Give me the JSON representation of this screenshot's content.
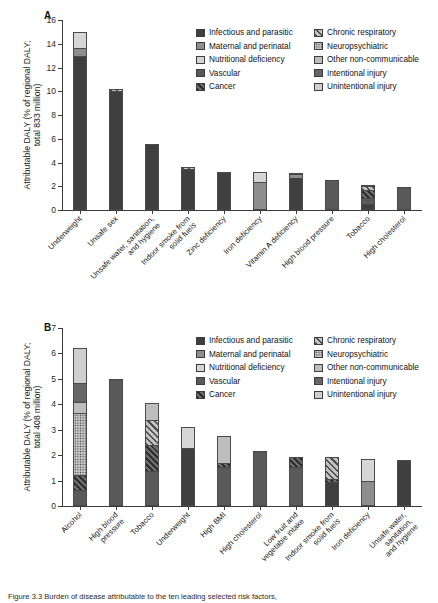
{
  "figure": {
    "caption": "Figure 3.3  Burden of disease attributable to the ten leading selected risk factors,",
    "panels": [
      "A",
      "B"
    ]
  },
  "legend": {
    "title": "",
    "entries": [
      {
        "label": "Infectious and parasitic",
        "key": "infectious",
        "color": "#3f3f3f",
        "pattern": "solid"
      },
      {
        "label": "Maternal and perinatal",
        "key": "maternal",
        "color": "#8d8d8d",
        "pattern": "solid"
      },
      {
        "label": "Nutritional deficiency",
        "key": "nutritional",
        "color": "#d6d6d6",
        "pattern": "solid"
      },
      {
        "label": "Vascular",
        "key": "vascular",
        "color": "#595959",
        "pattern": "solid"
      },
      {
        "label": "Cancer",
        "key": "cancer",
        "color": "#4a4a4a",
        "pattern": "diagonal-dark"
      },
      {
        "label": "Chronic respiratory",
        "key": "chronic_respiratory",
        "color": "#9a9a9a",
        "pattern": "diagonal-light"
      },
      {
        "label": "Neuropsychiatric",
        "key": "neuropsychiatric",
        "color": "#a8a8a8",
        "pattern": "dotted"
      },
      {
        "label": "Other non-communicable",
        "key": "other_noncomm",
        "color": "#bdbdbd",
        "pattern": "solid"
      },
      {
        "label": "Intentional injury",
        "key": "intentional_injury",
        "color": "#666666",
        "pattern": "solid"
      },
      {
        "label": "Unintentional injury",
        "key": "unintentional_injury",
        "color": "#cfcfcf",
        "pattern": "solid"
      }
    ]
  },
  "chart_data": [
    {
      "type": "bar",
      "panel": "A",
      "stacked": true,
      "title": "",
      "xlabel": "",
      "ylabel": "Attributable DALY (% of regional DALY; total 833 million)",
      "ylabel_line1": "Attributable DALY (% of regional DALY;",
      "ylabel_line2": "total 833 million)",
      "ylim": [
        0,
        16
      ],
      "yticks": [
        0,
        2,
        4,
        6,
        8,
        10,
        12,
        14,
        16
      ],
      "grid": false,
      "legend_position": "top-right",
      "categories": [
        "Underweight",
        "Unsafe sex",
        "Unsafe water, sanitation, and hygiene",
        "Indoor smoke from solid fuels",
        "Zinc deficiency",
        "Iron deficiency",
        "Vitamin A deficiency",
        "High blood pressure",
        "Tobacco",
        "High cholesterol"
      ],
      "category_lines": [
        [
          "Underweight"
        ],
        [
          "Unsafe sex"
        ],
        [
          "Unsafe water, sanitation,",
          "and hygiene"
        ],
        [
          "Indoor smoke from",
          "solid fuels"
        ],
        [
          "Zinc deficiency"
        ],
        [
          "Iron deficiency"
        ],
        [
          "Vitamin A deficiency"
        ],
        [
          "High blood pressure"
        ],
        [
          "Tobacco"
        ],
        [
          "High cholesterol"
        ]
      ],
      "totals": [
        15.0,
        10.2,
        5.55,
        3.65,
        3.2,
        3.2,
        3.1,
        2.55,
        2.1,
        1.9
      ],
      "series": [
        {
          "name": "Infectious and parasitic",
          "key": "infectious",
          "values": [
            12.95,
            10.05,
            5.55,
            3.45,
            3.2,
            0.0,
            2.65,
            0.0,
            0.4,
            0.0
          ]
        },
        {
          "name": "Maternal and perinatal",
          "key": "maternal",
          "values": [
            0.65,
            0.0,
            0.0,
            0.0,
            0.0,
            2.3,
            0.35,
            0.0,
            0.0,
            0.0
          ]
        },
        {
          "name": "Nutritional deficiency",
          "key": "nutritional",
          "values": [
            1.4,
            0.0,
            0.0,
            0.0,
            0.0,
            0.9,
            0.0,
            0.0,
            0.0,
            0.0
          ]
        },
        {
          "name": "Vascular",
          "key": "vascular",
          "values": [
            0.0,
            0.0,
            0.0,
            0.0,
            0.0,
            0.0,
            0.0,
            2.55,
            0.55,
            1.9
          ]
        },
        {
          "name": "Cancer",
          "key": "cancer",
          "values": [
            0.0,
            0.0,
            0.0,
            0.0,
            0.0,
            0.0,
            0.0,
            0.0,
            0.7,
            0.0
          ]
        },
        {
          "name": "Chronic respiratory",
          "key": "chronic_respiratory",
          "values": [
            0.0,
            0.15,
            0.0,
            0.2,
            0.0,
            0.0,
            0.0,
            0.0,
            0.35,
            0.0
          ]
        },
        {
          "name": "Other non-communicable",
          "key": "other_noncomm",
          "values": [
            0.0,
            0.0,
            0.0,
            0.0,
            0.0,
            0.0,
            0.1,
            0.0,
            0.1,
            0.0
          ]
        }
      ]
    },
    {
      "type": "bar",
      "panel": "B",
      "stacked": true,
      "title": "",
      "xlabel": "",
      "ylabel": "Attributable DALY (% of regional DALY; total 408 million)",
      "ylabel_line1": "Attributable DALY (% of regional DALY;",
      "ylabel_line2": "total 408 million)",
      "ylim": [
        0,
        7
      ],
      "yticks": [
        0,
        1,
        2,
        3,
        4,
        5,
        6,
        7
      ],
      "grid": false,
      "legend_position": "top-right",
      "categories": [
        "Alcohol",
        "High blood pressure",
        "Tobacco",
        "Underweight",
        "High BMI",
        "High cholesterol",
        "Low fruit and vegetable intake",
        "Indoor smoke from solid fuels",
        "Iron deficiency",
        "Unsafe water, sanitation, and hygiene"
      ],
      "category_lines": [
        [
          "Alcohol"
        ],
        [
          "High blood",
          "pressure"
        ],
        [
          "Tobacco"
        ],
        [
          "Underweight"
        ],
        [
          "High BMI"
        ],
        [
          "High cholesterol"
        ],
        [
          "Low fruit and",
          "vegetable intake"
        ],
        [
          "Indoor smoke from",
          "solid fuels"
        ],
        [
          "Iron deficiency"
        ],
        [
          "Unsafe water,",
          "sanitation,",
          "and hygiene"
        ]
      ],
      "totals": [
        6.22,
        5.01,
        4.05,
        3.11,
        2.75,
        2.15,
        1.93,
        1.92,
        1.85,
        1.8
      ],
      "series": [
        {
          "name": "Infectious and parasitic",
          "key": "infectious",
          "values": [
            0.0,
            0.0,
            0.0,
            2.25,
            0.0,
            0.0,
            0.0,
            0.9,
            0.0,
            1.8
          ]
        },
        {
          "name": "Maternal and perinatal",
          "key": "maternal",
          "values": [
            0.0,
            0.0,
            0.0,
            0.0,
            0.0,
            0.0,
            0.0,
            0.0,
            0.93,
            0.0
          ]
        },
        {
          "name": "Nutritional deficiency",
          "key": "nutritional",
          "values": [
            0.0,
            0.0,
            0.0,
            0.86,
            0.0,
            0.0,
            0.0,
            0.0,
            0.92,
            0.0
          ]
        },
        {
          "name": "Vascular",
          "key": "vascular",
          "values": [
            0.57,
            5.01,
            1.33,
            0.0,
            1.48,
            2.15,
            1.52,
            0.0,
            0.0,
            0.0
          ]
        },
        {
          "name": "Cancer",
          "key": "cancer",
          "values": [
            0.58,
            0.0,
            1.04,
            0.0,
            0.2,
            0.0,
            0.41,
            0.12,
            0.0,
            0.0
          ]
        },
        {
          "name": "Chronic respiratory",
          "key": "chronic_respiratory",
          "values": [
            0.0,
            0.0,
            1.0,
            0.0,
            0.0,
            0.0,
            0.0,
            0.9,
            0.0,
            0.0
          ]
        },
        {
          "name": "Neuropsychiatric",
          "key": "neuropsychiatric",
          "values": [
            2.47,
            0.0,
            0.0,
            0.0,
            0.0,
            0.0,
            0.0,
            0.0,
            0.0,
            0.0
          ]
        },
        {
          "name": "Other non-communicable",
          "key": "other_noncomm",
          "values": [
            0.45,
            0.0,
            0.68,
            0.0,
            1.07,
            0.0,
            0.0,
            0.0,
            0.0,
            0.0
          ]
        },
        {
          "name": "Intentional injury",
          "key": "intentional_injury",
          "values": [
            0.75,
            0.0,
            0.0,
            0.0,
            0.0,
            0.0,
            0.0,
            0.0,
            0.0,
            0.0
          ]
        },
        {
          "name": "Unintentional injury",
          "key": "unintentional_injury",
          "values": [
            1.4,
            0.0,
            0.0,
            0.0,
            0.0,
            0.0,
            0.0,
            0.0,
            0.0,
            0.0
          ]
        }
      ]
    }
  ]
}
